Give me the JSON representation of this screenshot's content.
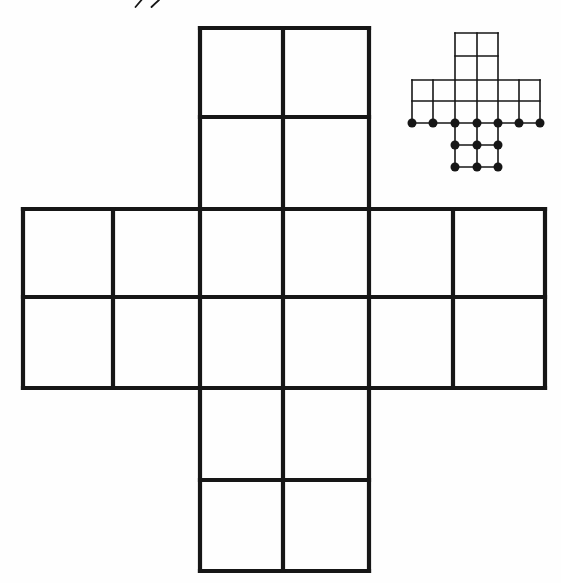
{
  "canvas": {
    "width": 561,
    "height": 583
  },
  "colors": {
    "background": "#fefefe",
    "ink": "#161616"
  },
  "diagram": {
    "main_grid": {
      "x_lines": [
        23,
        113,
        200,
        283,
        369,
        453,
        545
      ],
      "y_lines": [
        28,
        117,
        209,
        297,
        388,
        480,
        571
      ],
      "h_segments": [
        [
          0,
          2,
          4
        ],
        [
          1,
          2,
          4
        ],
        [
          2,
          0,
          6
        ],
        [
          3,
          0,
          6
        ],
        [
          4,
          0,
          6
        ],
        [
          5,
          2,
          4
        ],
        [
          6,
          2,
          4
        ]
      ],
      "v_segments": [
        [
          0,
          2,
          4
        ],
        [
          1,
          2,
          4
        ],
        [
          2,
          0,
          6
        ],
        [
          3,
          0,
          6
        ],
        [
          4,
          0,
          6
        ],
        [
          5,
          2,
          4
        ],
        [
          6,
          2,
          4
        ]
      ],
      "stroke_width": 4.2
    },
    "inset_grid": {
      "x_lines": [
        412,
        433,
        455,
        477,
        498,
        519,
        540
      ],
      "y_lines": [
        33,
        56,
        80,
        101,
        123,
        145,
        167
      ],
      "h_segments": [
        [
          0,
          2,
          4
        ],
        [
          1,
          2,
          4
        ],
        [
          2,
          0,
          6
        ],
        [
          3,
          0,
          6
        ],
        [
          4,
          0,
          6
        ],
        [
          5,
          2,
          4
        ],
        [
          6,
          2,
          4
        ]
      ],
      "v_segments": [
        [
          0,
          2,
          4
        ],
        [
          1,
          2,
          4
        ],
        [
          2,
          0,
          6
        ],
        [
          3,
          0,
          6
        ],
        [
          4,
          0,
          6
        ],
        [
          5,
          2,
          4
        ],
        [
          6,
          2,
          4
        ]
      ],
      "stroke_width": 1.6,
      "dots": [
        [
          0,
          4
        ],
        [
          1,
          4
        ],
        [
          2,
          4
        ],
        [
          3,
          4
        ],
        [
          4,
          4
        ],
        [
          5,
          4
        ],
        [
          6,
          4
        ],
        [
          2,
          5
        ],
        [
          3,
          5
        ],
        [
          4,
          5
        ],
        [
          2,
          6
        ],
        [
          3,
          6
        ],
        [
          4,
          6
        ]
      ],
      "dot_radius": 4.5
    },
    "stray_marks": {
      "stroke_width": 1.8,
      "paths": [
        "M135.5,7 Q138.5,3.5 141.5,0",
        "M151.5,7 Q155,3.5 159,0"
      ]
    }
  }
}
